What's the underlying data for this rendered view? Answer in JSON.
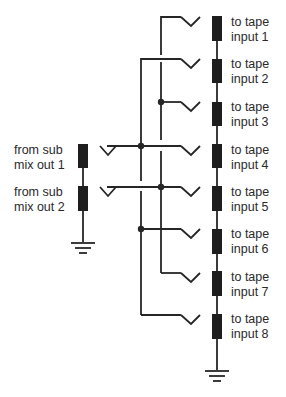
{
  "diagram": {
    "type": "patchbay-wiring",
    "line_color": "#262626",
    "resistor_color": "#1e1e1e",
    "background": "#ffffff",
    "sources": [
      {
        "id": "sub1",
        "line1": "from sub",
        "line2": "mix out 1"
      },
      {
        "id": "sub2",
        "line1": "from sub",
        "line2": "mix out 2"
      }
    ],
    "destinations": [
      {
        "id": "in1",
        "line1": "to tape",
        "line2": "input 1"
      },
      {
        "id": "in2",
        "line1": "to tape",
        "line2": "input 2"
      },
      {
        "id": "in3",
        "line1": "to tape",
        "line2": "input 3"
      },
      {
        "id": "in4",
        "line1": "to tape",
        "line2": "input 4"
      },
      {
        "id": "in5",
        "line1": "to tape",
        "line2": "input 5"
      },
      {
        "id": "in6",
        "line1": "to tape",
        "line2": "input 6"
      },
      {
        "id": "in7",
        "line1": "to tape",
        "line2": "input 7"
      },
      {
        "id": "in8",
        "line1": "to tape",
        "line2": "input 8"
      }
    ],
    "connections": [
      {
        "from": "sub1",
        "to": [
          "in2",
          "in4",
          "in6",
          "in8"
        ]
      },
      {
        "from": "sub2",
        "to": [
          "in1",
          "in3",
          "in5",
          "in7"
        ]
      }
    ]
  }
}
